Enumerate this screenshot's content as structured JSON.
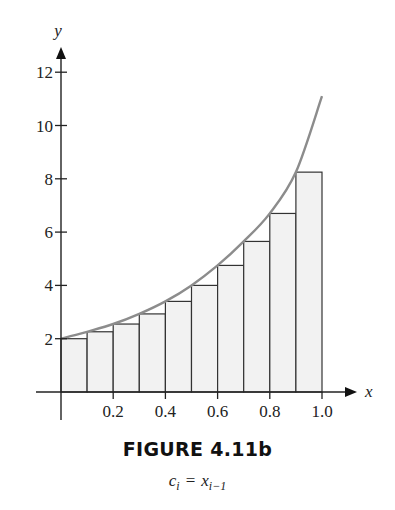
{
  "chart_data": {
    "type": "bar",
    "subtype": "riemann-sum-left-endpoint",
    "title": "FIGURE 4.11b",
    "subtitle": "c_i = x_{i-1}",
    "xlabel": "x",
    "ylabel": "y",
    "xlim": [
      0,
      1.0
    ],
    "ylim": [
      0,
      12
    ],
    "x_ticks": [
      0.2,
      0.4,
      0.6,
      0.8,
      1.0
    ],
    "x_tick_labels": [
      "0.2",
      "0.4",
      "0.6",
      "0.8",
      "1.0"
    ],
    "y_ticks": [
      2,
      4,
      6,
      8,
      10,
      12
    ],
    "y_tick_labels": [
      "2",
      "4",
      "6",
      "8",
      "10",
      "12"
    ],
    "grid": false,
    "legend": "none",
    "bars": {
      "x_left": [
        0.0,
        0.1,
        0.2,
        0.3,
        0.4,
        0.5,
        0.6,
        0.7,
        0.8,
        0.9
      ],
      "width": 0.1,
      "heights": [
        2.0,
        2.26,
        2.55,
        2.93,
        3.4,
        4.0,
        4.75,
        5.65,
        6.7,
        8.25
      ],
      "fill": "#f2f2f2",
      "stroke": "#333333"
    },
    "curve": {
      "description": "increasing function f(x), f(0)=2, f(1)≈11.1",
      "x": [
        0.0,
        0.1,
        0.2,
        0.3,
        0.4,
        0.5,
        0.6,
        0.7,
        0.8,
        0.9,
        1.0
      ],
      "y": [
        2.0,
        2.26,
        2.55,
        2.93,
        3.4,
        4.0,
        4.75,
        5.65,
        6.7,
        8.25,
        11.1
      ],
      "color": "#8c8c8c"
    }
  },
  "caption": {
    "title": "FIGURE 4.11b",
    "c": "c",
    "i": "i",
    "eq": "=",
    "x": "x",
    "im1": "i−1"
  }
}
